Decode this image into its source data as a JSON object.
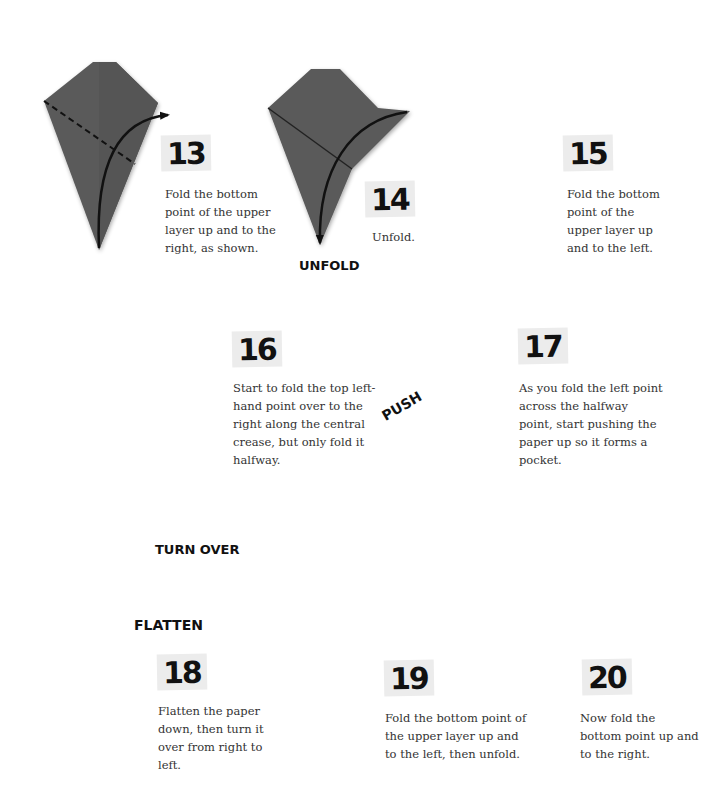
{
  "steps": [
    {
      "number": "13",
      "text": "Fold the bottom point of the upper layer up and to the right, as shown."
    },
    {
      "number": "14",
      "text": "Unfold.",
      "annotation": "UNFOLD"
    },
    {
      "number": "15",
      "text": "Fold the bottom point of the upper layer up and to the left."
    },
    {
      "number": "16",
      "text": "Start to fold the top left-hand point over to the right along the central crease, but only fold it halfway."
    },
    {
      "number": "17",
      "text": "As you fold the left point across the halfway point, start pushing the paper up so it forms a pocket.",
      "annotation": "PUSH"
    },
    {
      "number": "18",
      "text": "Flatten the paper down, then turn it over from right to left.",
      "annotation": "FLATTEN",
      "annotation2": "TURN OVER"
    },
    {
      "number": "19",
      "text": "Fold the bottom point of the upper layer up and to the left, then unfold."
    },
    {
      "number": "20",
      "text": "Now fold the bottom point up and to the right."
    }
  ],
  "colors": {
    "paper": "#5a5a5a",
    "paper_dark": "#464646",
    "paper_light": "#666666",
    "ink": "#111111",
    "number_bg": "#ececec"
  }
}
